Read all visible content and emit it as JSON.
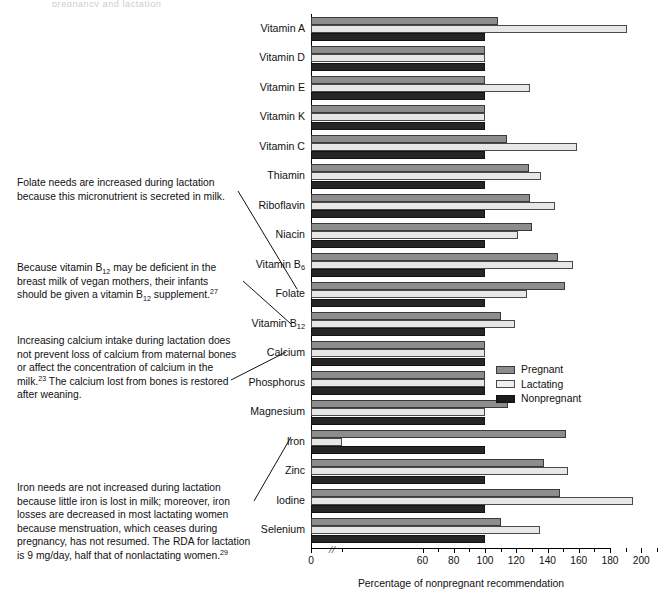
{
  "artifacts": {
    "top_left": "pregnancy and lactation",
    "top_right": ""
  },
  "notes": [
    {
      "id": "note-folate",
      "text": "Folate needs are increased during lactation because this micronutrient is secreted in milk."
    },
    {
      "id": "note-b12",
      "text": "Because vitamin B12 may be deficient in the breast milk of vegan mothers, their infants should be given a vitamin B12 supplement.27"
    },
    {
      "id": "note-calcium",
      "text": "Increasing calcium intake during lactation does not prevent loss of calcium from maternal bones or affect the concentration of calcium in the milk.23 The calcium lost from bones is restored after weaning."
    },
    {
      "id": "note-iron",
      "text": "Iron needs are not increased during lactation because little iron is lost in milk; moreover, iron losses are decreased in most lactating women because menstruation, which ceases during pregnancy, has not resumed. The RDA for lactation is 9 mg/day, half that of nonlactating women.29"
    }
  ],
  "legend": {
    "position": "right-middle",
    "entries": [
      {
        "label": "Pregnant",
        "color": "#8d8d8d"
      },
      {
        "label": "Lactating",
        "color": "#efefef"
      },
      {
        "label": "Nonpregnant",
        "color": "#1c1c1c"
      }
    ]
  },
  "chart_data": {
    "type": "bar",
    "orientation": "horizontal",
    "title": "",
    "xlabel": "Percentage of nonpregnant recommendation",
    "ylabel": "",
    "xlim": [
      0,
      210
    ],
    "axis_break": {
      "present": true,
      "between": [
        0,
        50
      ]
    },
    "xticks": [
      0,
      60,
      80,
      100,
      120,
      140,
      160,
      180,
      200
    ],
    "grid": false,
    "categories": [
      "Vitamin A",
      "Vitamin D",
      "Vitamin E",
      "Vitamin K",
      "Vitamin C",
      "Thiamin",
      "Riboflavin",
      "Niacin",
      "Vitamin B6",
      "Folate",
      "Vitamin B12",
      "Calcium",
      "Phosphorus",
      "Magnesium",
      "Iron",
      "Zinc",
      "Iodine",
      "Selenium"
    ],
    "series": [
      {
        "name": "Pregnant",
        "color": "#8d8d8d",
        "values": [
          108,
          100,
          100,
          100,
          114,
          128,
          129,
          130,
          147,
          151,
          110,
          100,
          100,
          115,
          152,
          138,
          148,
          110
        ]
      },
      {
        "name": "Lactating",
        "color": "#efefef",
        "values": [
          191,
          100,
          129,
          100,
          159,
          136,
          145,
          121,
          156,
          127,
          119,
          100,
          100,
          100,
          50,
          153,
          195,
          135
        ]
      },
      {
        "name": "Nonpregnant",
        "color": "#1c1c1c",
        "values": [
          100,
          100,
          100,
          100,
          100,
          100,
          100,
          100,
          100,
          100,
          100,
          100,
          100,
          100,
          100,
          100,
          100,
          100
        ]
      }
    ]
  }
}
